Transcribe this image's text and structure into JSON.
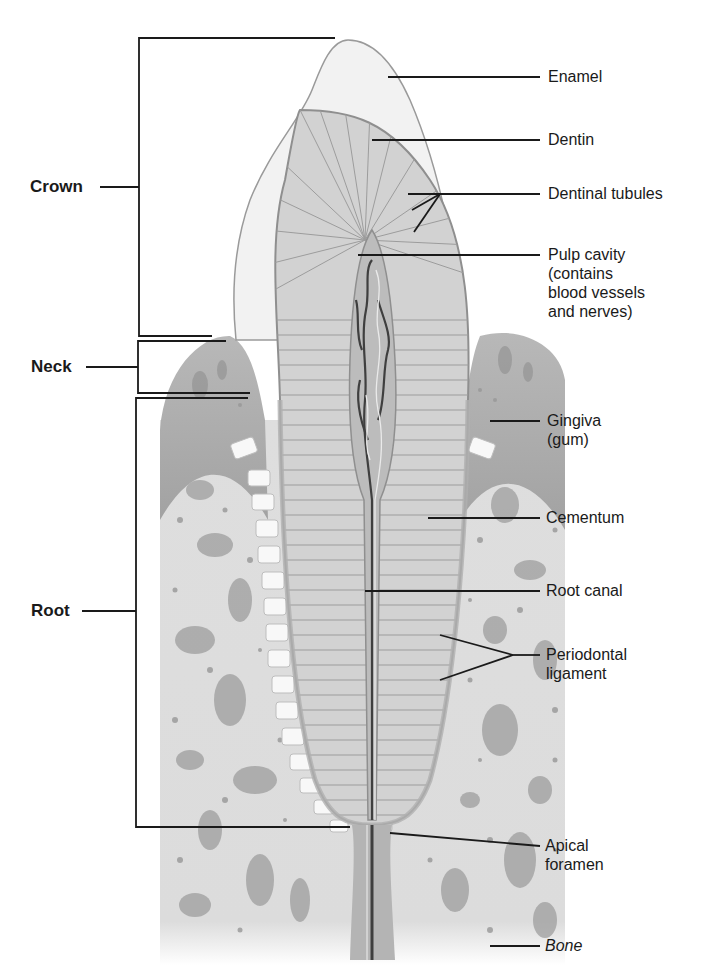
{
  "figure": {
    "colors": {
      "background": "#ffffff",
      "line": "#1a1a1a",
      "enamel": "#f3f3f3",
      "dentin": "#cfcfcf",
      "pulp": "#b9b9b9",
      "gingiva": "#a9a9a9",
      "bone": "#dcdcdc",
      "bone_spot": "#9a9a9a",
      "ligament": "#f7f7f7",
      "vessel": "#444444"
    }
  },
  "regions": [
    {
      "id": "crown",
      "label": "Crown"
    },
    {
      "id": "neck",
      "label": "Neck"
    },
    {
      "id": "root",
      "label": "Root"
    }
  ],
  "labels": [
    {
      "id": "enamel",
      "text": "Enamel"
    },
    {
      "id": "dentin",
      "text": "Dentin"
    },
    {
      "id": "dentinal-tubules",
      "text": "Dentinal tubules"
    },
    {
      "id": "pulp-cavity",
      "text": "Pulp cavity\n(contains\nblood vessels\nand nerves)"
    },
    {
      "id": "gingiva",
      "text": "Gingiva\n(gum)"
    },
    {
      "id": "cementum",
      "text": "Cementum"
    },
    {
      "id": "root-canal",
      "text": "Root canal"
    },
    {
      "id": "periodontal-ligament",
      "text": "Periodontal\nligament"
    },
    {
      "id": "apical-foramen",
      "text": "Apical\nforamen"
    },
    {
      "id": "bone",
      "text": "Bone"
    }
  ]
}
